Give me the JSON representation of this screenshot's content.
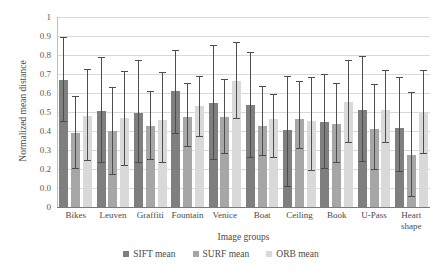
{
  "chart_data": {
    "type": "bar",
    "title": "",
    "xlabel": "Image groups",
    "ylabel": "Normalized mean distance",
    "ylim": [
      0,
      1
    ],
    "grid": true,
    "legend_position": "bottom",
    "ytick_labels": [
      "1",
      "0.9",
      "0.8",
      "0.7",
      "0.6",
      "0.5",
      "0.4",
      "0.3",
      "0.2",
      "0.0",
      "0"
    ],
    "ytick_values": [
      1.0,
      0.9,
      0.8,
      0.7,
      0.6,
      0.5,
      0.4,
      0.3,
      0.2,
      0.1,
      0.0
    ],
    "categories": [
      "Bikes",
      "Leuven",
      "Graffiti",
      "Fountain",
      "Venice",
      "Boat",
      "Ceiling",
      "Book",
      "U-Pass",
      "Heart shape"
    ],
    "category_lines": [
      [
        "Bikes"
      ],
      [
        "Leuven"
      ],
      [
        "Graffiti"
      ],
      [
        "Fountain"
      ],
      [
        "Venice"
      ],
      [
        "Boat"
      ],
      [
        "Ceiling"
      ],
      [
        "Book"
      ],
      [
        "U-Pass"
      ],
      [
        "Heart",
        "shape"
      ]
    ],
    "series": [
      {
        "name": "SIFT mean",
        "color": "#7f7f7f",
        "values": [
          0.67,
          0.505,
          0.495,
          0.61,
          0.55,
          0.535,
          0.405,
          0.445,
          0.51,
          0.415
        ],
        "err_low": [
          0.45,
          0.23,
          0.23,
          0.385,
          0.25,
          0.26,
          0.105,
          0.2,
          0.235,
          0.185
        ],
        "err_high": [
          0.89,
          0.785,
          0.77,
          0.82,
          0.845,
          0.81,
          0.685,
          0.695,
          0.79,
          0.68
        ]
      },
      {
        "name": "SURF mean",
        "color": "#a6a6a6",
        "values": [
          0.39,
          0.4,
          0.425,
          0.475,
          0.475,
          0.425,
          0.465,
          0.435,
          0.41,
          0.275
        ],
        "err_low": [
          0.2,
          0.17,
          0.25,
          0.315,
          0.28,
          0.27,
          0.305,
          0.23,
          0.195,
          0.055
        ],
        "err_high": [
          0.58,
          0.625,
          0.605,
          0.645,
          0.67,
          0.63,
          0.66,
          0.65,
          0.64,
          0.6
        ]
      },
      {
        "name": "ORB mean",
        "color": "#d9d9d9",
        "values": [
          0.48,
          0.47,
          0.46,
          0.53,
          0.665,
          0.465,
          0.455,
          0.555,
          0.51,
          0.495
        ],
        "err_low": [
          0.24,
          0.215,
          0.23,
          0.37,
          0.465,
          0.26,
          0.19,
          0.335,
          0.335,
          0.28
        ],
        "err_high": [
          0.72,
          0.71,
          0.705,
          0.685,
          0.865,
          0.59,
          0.68,
          0.77,
          0.715,
          0.715
        ]
      }
    ]
  },
  "legend": {
    "items": [
      {
        "label": "SIFT mean",
        "color": "#7f7f7f"
      },
      {
        "label": "SURF mean",
        "color": "#a6a6a6"
      },
      {
        "label": "ORB mean",
        "color": "#d9d9d9"
      }
    ]
  }
}
